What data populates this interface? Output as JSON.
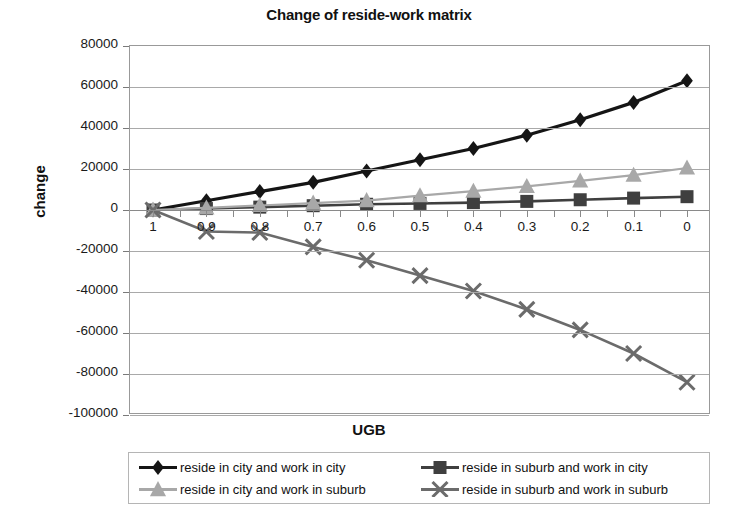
{
  "chart_data": {
    "type": "line",
    "title": "Change of reside-work matrix",
    "xlabel": "UGB",
    "ylabel": "change",
    "categories": [
      "1",
      "0.9",
      "0.8",
      "0.7",
      "0.6",
      "0.5",
      "0.4",
      "0.3",
      "0.2",
      "0.1",
      "0"
    ],
    "ylim": [
      -100000,
      80000
    ],
    "ytick_step": 20000,
    "yticks": [
      "80000",
      "60000",
      "40000",
      "20000",
      "0",
      "-20000",
      "-40000",
      "-60000",
      "-80000",
      "-100000"
    ],
    "ytick_values": [
      80000,
      60000,
      40000,
      20000,
      0,
      -20000,
      -40000,
      -60000,
      -80000,
      -100000
    ],
    "grid": true,
    "legend_position": "bottom",
    "series": [
      {
        "name": "reside in city and work in city",
        "marker": "diamond",
        "color": "#151515",
        "values": [
          0,
          4500,
          9000,
          13500,
          19000,
          24500,
          30000,
          36500,
          44000,
          52500,
          63000
        ]
      },
      {
        "name": "reside in suburb and work in city",
        "marker": "square",
        "color": "#3f3f3f",
        "values": [
          0,
          700,
          1400,
          2100,
          2800,
          3200,
          3600,
          4200,
          5000,
          5800,
          6500
        ]
      },
      {
        "name": "reside in city and work in suburb",
        "marker": "triangle",
        "color": "#a8a8a8",
        "values": [
          0,
          1000,
          2200,
          3400,
          4600,
          7000,
          9200,
          11500,
          14200,
          17000,
          20500
        ]
      },
      {
        "name": "reside in suburb and work in suburb",
        "marker": "cross",
        "color": "#6b6b6b",
        "values": [
          0,
          -10500,
          -11000,
          -18000,
          -24500,
          -32000,
          -39500,
          -48500,
          -58500,
          -70000,
          -84000
        ]
      }
    ]
  }
}
